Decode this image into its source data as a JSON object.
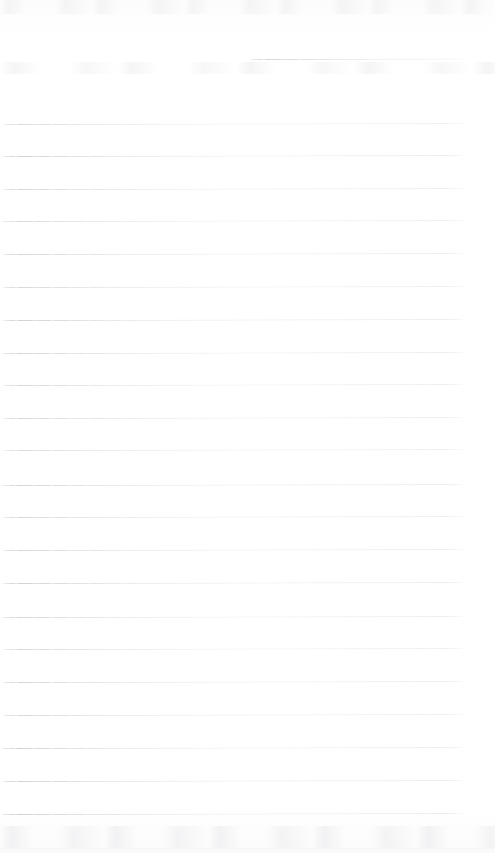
{
  "document": {
    "kind": "scanned-lined-paper",
    "title": "Blank ruled notebook page",
    "page_width": 495,
    "page_height": 853,
    "background_color": "#fefefe",
    "rule_color": "#b9bdc2",
    "rule_thickness_px": 1,
    "rule_spacing_px": 32.8,
    "rule_count": 24,
    "text_content": "",
    "has_handwriting": false
  },
  "rules": [
    {
      "name": "rule-partial-top",
      "y": 59,
      "x": 250,
      "width": 216,
      "opacity": 0.62,
      "tilt_deg": -0.12,
      "partial": "true"
    },
    {
      "name": "rule-01",
      "y": 124,
      "x": 3,
      "width": 460,
      "opacity": 0.58,
      "tilt_deg": -0.1,
      "partial": "false"
    },
    {
      "name": "rule-02",
      "y": 156,
      "x": 3,
      "width": 460,
      "opacity": 0.7,
      "tilt_deg": -0.1,
      "partial": "false"
    },
    {
      "name": "rule-03",
      "y": 189,
      "x": 3,
      "width": 460,
      "opacity": 0.64,
      "tilt_deg": -0.09,
      "partial": "false"
    },
    {
      "name": "rule-04",
      "y": 221,
      "x": 2,
      "width": 461,
      "opacity": 0.6,
      "tilt_deg": -0.1,
      "partial": "false"
    },
    {
      "name": "rule-05",
      "y": 254,
      "x": 3,
      "width": 460,
      "opacity": 0.66,
      "tilt_deg": -0.1,
      "partial": "false"
    },
    {
      "name": "rule-06",
      "y": 287,
      "x": 3,
      "width": 460,
      "opacity": 0.62,
      "tilt_deg": -0.09,
      "partial": "false"
    },
    {
      "name": "rule-07",
      "y": 320,
      "x": 3,
      "width": 460,
      "opacity": 0.72,
      "tilt_deg": -0.1,
      "partial": "false"
    },
    {
      "name": "rule-08",
      "y": 353,
      "x": 2,
      "width": 461,
      "opacity": 0.66,
      "tilt_deg": -0.1,
      "partial": "false"
    },
    {
      "name": "rule-09",
      "y": 385,
      "x": 3,
      "width": 460,
      "opacity": 0.62,
      "tilt_deg": -0.09,
      "partial": "false"
    },
    {
      "name": "rule-10",
      "y": 418,
      "x": 3,
      "width": 460,
      "opacity": 0.64,
      "tilt_deg": -0.1,
      "partial": "false"
    },
    {
      "name": "rule-11",
      "y": 450,
      "x": 3,
      "width": 460,
      "opacity": 0.58,
      "tilt_deg": -0.1,
      "partial": "false"
    },
    {
      "name": "rule-12",
      "y": 485,
      "x": 2,
      "width": 461,
      "opacity": 0.68,
      "tilt_deg": -0.09,
      "partial": "false"
    },
    {
      "name": "rule-13",
      "y": 517,
      "x": 3,
      "width": 460,
      "opacity": 0.62,
      "tilt_deg": -0.1,
      "partial": "false"
    },
    {
      "name": "rule-14",
      "y": 550,
      "x": 3,
      "width": 460,
      "opacity": 0.66,
      "tilt_deg": -0.1,
      "partial": "false"
    },
    {
      "name": "rule-15",
      "y": 583,
      "x": 3,
      "width": 460,
      "opacity": 0.7,
      "tilt_deg": -0.09,
      "partial": "false"
    },
    {
      "name": "rule-16",
      "y": 617,
      "x": 2,
      "width": 461,
      "opacity": 0.64,
      "tilt_deg": -0.1,
      "partial": "false"
    },
    {
      "name": "rule-17",
      "y": 649,
      "x": 3,
      "width": 460,
      "opacity": 0.6,
      "tilt_deg": -0.1,
      "partial": "false"
    },
    {
      "name": "rule-18",
      "y": 682,
      "x": 3,
      "width": 460,
      "opacity": 0.66,
      "tilt_deg": -0.09,
      "partial": "false"
    },
    {
      "name": "rule-19",
      "y": 715,
      "x": 3,
      "width": 460,
      "opacity": 0.62,
      "tilt_deg": -0.1,
      "partial": "false"
    },
    {
      "name": "rule-20",
      "y": 748,
      "x": 2,
      "width": 461,
      "opacity": 0.68,
      "tilt_deg": -0.1,
      "partial": "false"
    },
    {
      "name": "rule-21",
      "y": 781,
      "x": 3,
      "width": 460,
      "opacity": 0.7,
      "tilt_deg": -0.09,
      "partial": "false"
    },
    {
      "name": "rule-22",
      "y": 814,
      "x": 2,
      "width": 461,
      "opacity": 0.72,
      "tilt_deg": -0.1,
      "partial": "false"
    }
  ],
  "artifacts": [
    {
      "name": "scan-smudge-top",
      "label": "faint scanner smudge along top edge"
    },
    {
      "name": "scan-smudge-upper-band",
      "label": "faint scanner smudge below first rule"
    },
    {
      "name": "scan-smudge-bottom",
      "label": "faint scanner smudge along bottom edge"
    },
    {
      "name": "scan-smudge-bottom-edge",
      "label": "faint gradient at lower page edge"
    }
  ]
}
